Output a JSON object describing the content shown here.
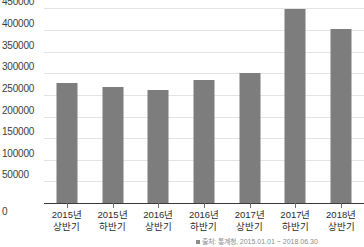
{
  "chart_data": {
    "type": "bar",
    "title": "",
    "xlabel": "",
    "ylabel": "",
    "categories": [
      "2015년 상반기",
      "2015년 하반기",
      "2016년 상반기",
      "2016년 하반기",
      "2017년 상반기",
      "2017년 하반기",
      "2018년 상반기"
    ],
    "category_lines": [
      [
        "2015년",
        "상반기"
      ],
      [
        "2015년",
        "하반기"
      ],
      [
        "2016년",
        "상반기"
      ],
      [
        "2016년",
        "하반기"
      ],
      [
        "2017년",
        "상반기"
      ],
      [
        "2017년",
        "하반기"
      ],
      [
        "2018년",
        "상반기"
      ]
    ],
    "values": [
      277000,
      269000,
      262000,
      285000,
      300000,
      449000,
      403000
    ],
    "ylim": [
      0,
      465000
    ],
    "yticks": [
      50000,
      100000,
      150000,
      200000,
      250000,
      300000,
      350000,
      400000,
      450000
    ],
    "ytick_labels": [
      "50000",
      "100000",
      "150000",
      "200000",
      "250000",
      "300000",
      "350000",
      "400000",
      "450000"
    ],
    "zero_label": "0",
    "grid": true,
    "legend": false,
    "bar_color": "#7d7d7d",
    "grid_color": "#e3e3e3",
    "axis_color": "#3a3a3a",
    "text_color": "#2b2b2b"
  },
  "footer": {
    "source_note": "출처: 통계청, 2015.01.01 ~ 2018.06.30"
  }
}
